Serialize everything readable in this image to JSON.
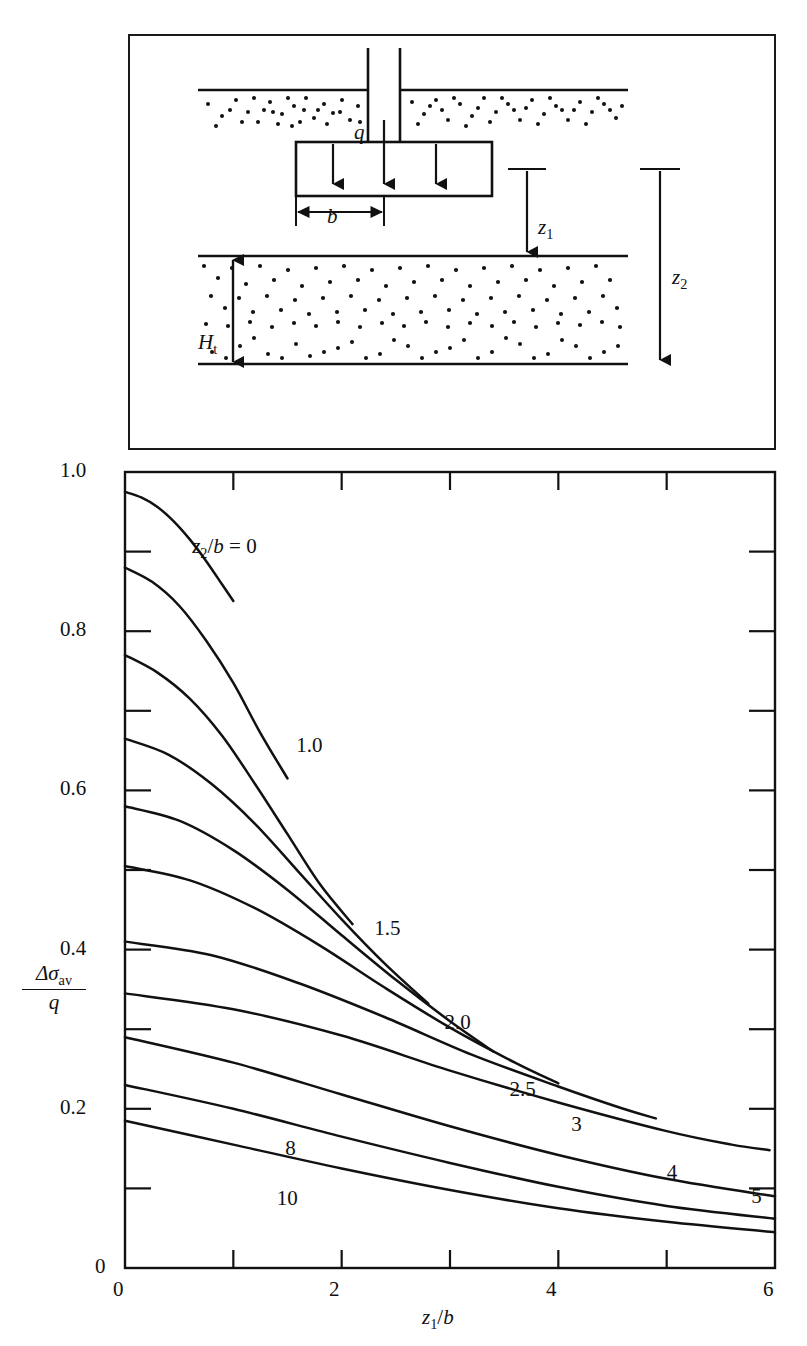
{
  "figure": {
    "title_visible": false,
    "panels": [
      "diagram",
      "chart"
    ]
  },
  "diagram": {
    "name": "footing-stress-diagram",
    "labels": {
      "load": "q",
      "width": "b",
      "depth_top": "z",
      "depth_top_sub": "1",
      "depth_bottom": "z",
      "depth_bottom_sub": "2",
      "layer_thickness": "H",
      "layer_thickness_sub": "t"
    },
    "elements": [
      "ground-surface-line",
      "column-stem",
      "spread-footing",
      "load-arrows",
      "width-dimension",
      "compressible-layer",
      "bottom-stratum-line",
      "z1-dimension-arrow",
      "z2-dimension-arrow",
      "Ht-dimension-arrow"
    ]
  },
  "chart_data": {
    "type": "line",
    "title": "",
    "xlabel": "z1/b",
    "ylabel": "Δσav / q",
    "xlabel_parts": {
      "var": "z",
      "sub": "1",
      "denom": "b"
    },
    "ylabel_parts": {
      "num_delta": "Δσ",
      "num_sub": "av",
      "denom": "q"
    },
    "xlim": [
      0,
      6
    ],
    "ylim": [
      0,
      1.0
    ],
    "grid": false,
    "legend": "inline-curve-labels",
    "x_major_ticks": [
      0,
      2,
      4,
      6
    ],
    "x_major_tick_labels": [
      "0",
      "2",
      "4",
      "6"
    ],
    "x_minor_ticks": [
      1,
      3,
      5
    ],
    "y_major_ticks": [
      0,
      0.2,
      0.4,
      0.6,
      0.8,
      1.0
    ],
    "y_major_tick_labels": [
      "0",
      "0.2",
      "0.4",
      "0.6",
      "0.8",
      "1.0"
    ],
    "y_minor_ticks": [
      0.1,
      0.3,
      0.5,
      0.7,
      0.9
    ],
    "series_param_name": "z2/b",
    "series_label_prefix": "z2/b =",
    "series": [
      {
        "name": "0",
        "label": "z2/b = 0",
        "label_x": 0.62,
        "label_y": 0.905,
        "x": [
          0,
          0.15,
          0.3,
          0.45,
          0.6,
          0.75,
          0.9,
          1.0
        ],
        "values": [
          0.975,
          0.968,
          0.956,
          0.938,
          0.915,
          0.888,
          0.858,
          0.838
        ]
      },
      {
        "name": "1.0",
        "label": "1.0",
        "label_x": 1.58,
        "label_y": 0.655,
        "x": [
          0,
          0.25,
          0.5,
          0.75,
          1.0,
          1.25,
          1.5
        ],
        "values": [
          0.88,
          0.862,
          0.832,
          0.788,
          0.735,
          0.672,
          0.615
        ]
      },
      {
        "name": "1.5",
        "label": "1.5",
        "label_x": 2.3,
        "label_y": 0.425,
        "x": [
          0,
          0.3,
          0.6,
          0.9,
          1.2,
          1.5,
          1.8,
          2.1
        ],
        "values": [
          0.77,
          0.748,
          0.715,
          0.668,
          0.608,
          0.545,
          0.482,
          0.432
        ]
      },
      {
        "name": "2.0",
        "label": "2.0",
        "label_x": 2.95,
        "label_y": 0.307,
        "x": [
          0,
          0.4,
          0.8,
          1.2,
          1.6,
          2.0,
          2.4,
          2.8
        ],
        "values": [
          0.665,
          0.645,
          0.608,
          0.558,
          0.498,
          0.438,
          0.382,
          0.332
        ]
      },
      {
        "name": "2.5",
        "label": "2.5",
        "label_x": 3.55,
        "label_y": 0.222,
        "x": [
          0,
          0.5,
          1.0,
          1.5,
          2.0,
          2.5,
          3.0,
          3.4
        ],
        "values": [
          0.58,
          0.562,
          0.525,
          0.475,
          0.418,
          0.362,
          0.31,
          0.272
        ]
      },
      {
        "name": "3",
        "label": "3",
        "label_x": 4.12,
        "label_y": 0.178,
        "x": [
          0,
          0.6,
          1.2,
          1.8,
          2.4,
          3.0,
          3.6,
          4.0
        ],
        "values": [
          0.505,
          0.487,
          0.452,
          0.405,
          0.352,
          0.302,
          0.258,
          0.232
        ]
      },
      {
        "name": "4",
        "label": "4",
        "label_x": 5.0,
        "label_y": 0.118,
        "x": [
          0,
          0.8,
          1.6,
          2.4,
          3.2,
          4.0,
          4.6,
          4.9
        ],
        "values": [
          0.41,
          0.393,
          0.358,
          0.315,
          0.268,
          0.228,
          0.2,
          0.188
        ]
      },
      {
        "name": "5",
        "label": "5",
        "label_x": 5.78,
        "label_y": 0.088,
        "x": [
          0,
          1.0,
          2.0,
          3.0,
          4.0,
          5.0,
          5.6,
          5.95
        ],
        "values": [
          0.345,
          0.325,
          0.292,
          0.248,
          0.208,
          0.172,
          0.155,
          0.148
        ]
      },
      {
        "name": "8",
        "label": "8",
        "label_x": 1.48,
        "label_y": 0.148,
        "x": [
          0,
          1.0,
          2.0,
          3.0,
          4.0,
          5.0,
          6.0
        ],
        "values": [
          0.29,
          0.258,
          0.218,
          0.178,
          0.142,
          0.112,
          0.09
        ]
      },
      {
        "name": "10",
        "label": "10",
        "label_x": 1.4,
        "label_y": 0.085,
        "x": [
          0,
          1.0,
          2.0,
          3.0,
          4.0,
          5.0,
          6.0
        ],
        "values": [
          0.23,
          0.2,
          0.165,
          0.132,
          0.102,
          0.078,
          0.062
        ]
      },
      {
        "name": "extra-lowest",
        "label": "",
        "label_x": null,
        "label_y": null,
        "x": [
          0,
          1.0,
          2.0,
          3.0,
          4.0,
          5.0,
          6.0
        ],
        "values": [
          0.185,
          0.155,
          0.125,
          0.098,
          0.075,
          0.058,
          0.045
        ]
      }
    ],
    "colors": {
      "line": "#111111",
      "axis": "#111111",
      "background": "#ffffff"
    }
  }
}
